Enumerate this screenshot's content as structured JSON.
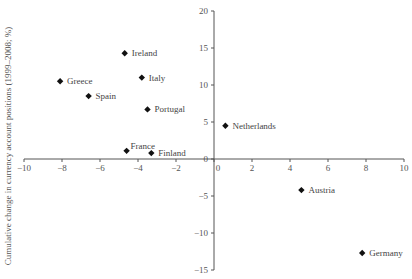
{
  "chart_data": {
    "type": "scatter",
    "title": "",
    "xlabel": "",
    "ylabel": "Cumulative change in currency account positions (1999–2008; %)",
    "xlim": [
      -10,
      10
    ],
    "ylim": [
      -15,
      20
    ],
    "x_ticks": [
      -10,
      -8,
      -6,
      -4,
      -2,
      0,
      2,
      4,
      6,
      8,
      10
    ],
    "y_ticks": [
      20,
      15,
      10,
      5,
      0,
      -5,
      -10,
      -15
    ],
    "grid": false,
    "legend": null,
    "marker": "diamond",
    "points": [
      {
        "label": "Ireland",
        "x": -4.7,
        "y": 14.3
      },
      {
        "label": "Greece",
        "x": -8.1,
        "y": 10.5
      },
      {
        "label": "Italy",
        "x": -3.8,
        "y": 11.0
      },
      {
        "label": "Spain",
        "x": -6.6,
        "y": 8.5
      },
      {
        "label": "Portugal",
        "x": -3.5,
        "y": 6.7
      },
      {
        "label": "France",
        "x": -4.6,
        "y": 1.1
      },
      {
        "label": "Finland",
        "x": -3.3,
        "y": 0.8
      },
      {
        "label": "Netherlands",
        "x": 0.6,
        "y": 4.5
      },
      {
        "label": "Austria",
        "x": 4.6,
        "y": -4.2
      },
      {
        "label": "Germany",
        "x": 7.8,
        "y": -12.7
      }
    ]
  },
  "colors": {
    "axis": "#555555",
    "marker": "#111111",
    "text": "#444444"
  }
}
